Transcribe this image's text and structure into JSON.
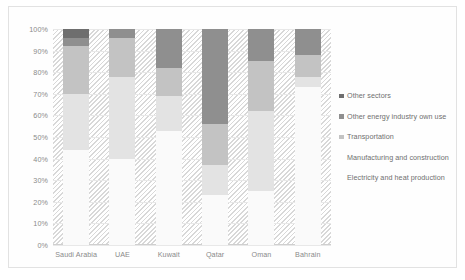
{
  "chart_data": {
    "type": "bar",
    "stacked": true,
    "title": "",
    "subtitle": "",
    "xlabel": "",
    "ylabel": "",
    "ylim": [
      0,
      100
    ],
    "ytick_labels": [
      "100%",
      "90%",
      "80%",
      "70%",
      "60%",
      "50%",
      "40%",
      "30%",
      "20%",
      "10%",
      "0%"
    ],
    "ytick_values": [
      100,
      90,
      80,
      70,
      60,
      50,
      40,
      30,
      20,
      10,
      0
    ],
    "grid": true,
    "legend_position": "right",
    "categories": [
      "Saudi Arabia",
      "UAE",
      "Kuwait",
      "Qatar",
      "Oman",
      "Bahrain"
    ],
    "series": [
      {
        "name": "Electricity and heat production",
        "color": "#fafafa",
        "values": [
          44,
          40,
          53,
          23,
          25,
          73
        ]
      },
      {
        "name": "Manufacturing and construction",
        "color": "#e3e3e3",
        "values": [
          26,
          38,
          16,
          14,
          37,
          5
        ]
      },
      {
        "name": "Transportation",
        "color": "#c3c3c3",
        "values": [
          22,
          18,
          13,
          19,
          23,
          10
        ]
      },
      {
        "name": "Other energy industry own use",
        "color": "#8f8f8f",
        "values": [
          4,
          4,
          18,
          44,
          15,
          12
        ]
      },
      {
        "name": "Other sectors",
        "color": "#6e6e6e",
        "values": [
          4,
          0,
          0,
          0,
          0,
          0
        ]
      }
    ]
  },
  "legend": {
    "items": [
      {
        "label": "Other sectors",
        "color": "#6e6e6e"
      },
      {
        "label": "Other energy industry own use",
        "color": "#8f8f8f"
      },
      {
        "label": "Transportation",
        "color": "#c3c3c3"
      },
      {
        "label": "Manufacturing and construction",
        "color": "#e3e3e3"
      },
      {
        "label": "Electricity and heat production",
        "color": "#fafafa"
      }
    ]
  }
}
